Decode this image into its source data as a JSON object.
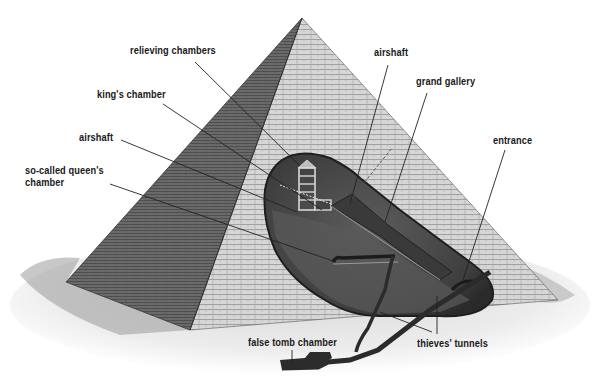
{
  "diagram": {
    "colors": {
      "background": "#ffffff",
      "left_face": "#6e6e6e",
      "right_face": "#cfcfcf",
      "cutaway": "#4a4a4a",
      "cutaway_floor": "#5e5e5e",
      "sand": "#e6e6e6",
      "leader_line": "#2a2a2a",
      "label_text": "#1a1a1a"
    },
    "labels": {
      "relieving_chambers": "relieving chambers",
      "kings_chamber": "king's chamber",
      "airshaft_left": "airshaft",
      "queens_chamber": "so-called queen's chamber",
      "airshaft_right": "airshaft",
      "grand_gallery": "grand gallery",
      "entrance": "entrance",
      "false_tomb_chamber": "false tomb chamber",
      "thieves_tunnels": "thieves' tunnels"
    }
  }
}
